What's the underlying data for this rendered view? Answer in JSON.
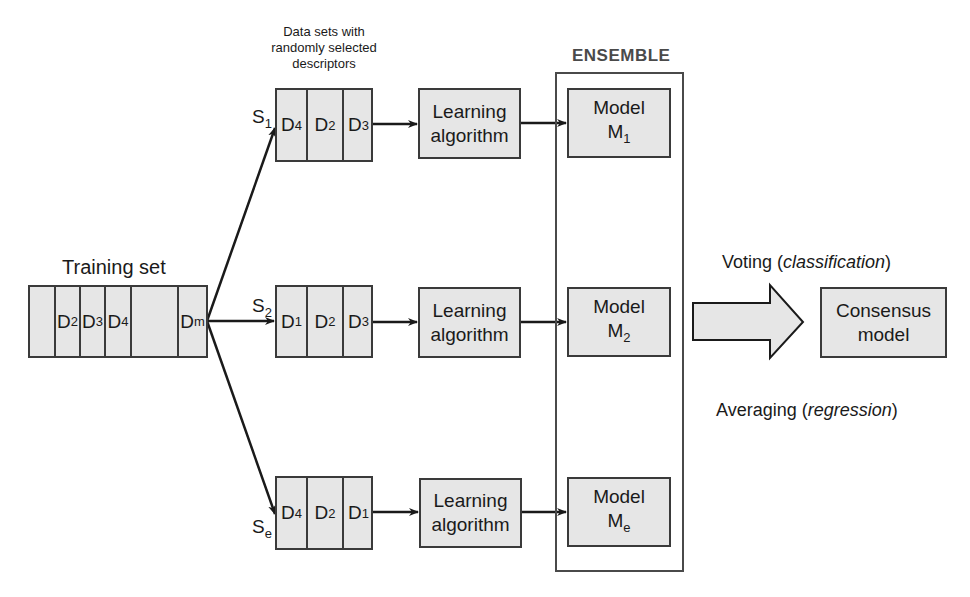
{
  "diagram": {
    "type": "random-subspace-ensemble-flow",
    "training_set": {
      "title": "Training set",
      "cells": [
        {
          "label": "",
          "sub": ""
        },
        {
          "label": "D",
          "sub": "2"
        },
        {
          "label": "D",
          "sub": "3"
        },
        {
          "label": "D",
          "sub": "4"
        },
        {
          "label": "",
          "sub": ""
        },
        {
          "label": "D",
          "sub": "m"
        }
      ]
    },
    "datasets_caption_lines": [
      "Data sets with",
      "randomly selected",
      "descriptors"
    ],
    "rows": [
      {
        "subset": {
          "label": "S",
          "sub": "1"
        },
        "cells": [
          {
            "label": "D",
            "sub": "4"
          },
          {
            "label": "D",
            "sub": "2"
          },
          {
            "label": "D",
            "sub": "3"
          }
        ],
        "learner": {
          "line1": "Learning",
          "line2": "algorithm"
        },
        "model": {
          "line1": "Model",
          "label": "M",
          "sub": "1"
        }
      },
      {
        "subset": {
          "label": "S",
          "sub": "2"
        },
        "cells": [
          {
            "label": "D",
            "sub": "1"
          },
          {
            "label": "D",
            "sub": "2"
          },
          {
            "label": "D",
            "sub": "3"
          }
        ],
        "learner": {
          "line1": "Learning",
          "line2": "algorithm"
        },
        "model": {
          "line1": "Model",
          "label": "M",
          "sub": "2"
        }
      },
      {
        "subset": {
          "label": "S",
          "sub": "e"
        },
        "cells": [
          {
            "label": "D",
            "sub": "4"
          },
          {
            "label": "D",
            "sub": "2"
          },
          {
            "label": "D",
            "sub": "1"
          }
        ],
        "learner": {
          "line1": "Learning",
          "line2": "algorithm"
        },
        "model": {
          "line1": "Model",
          "label": "M",
          "sub": "e"
        }
      }
    ],
    "ensemble": {
      "title": "ENSEMBLE"
    },
    "combination": {
      "voting": {
        "prefix": "Voting (",
        "italic": "classification",
        "suffix": ")"
      },
      "averaging": {
        "prefix": "Averaging (",
        "italic": "regression",
        "suffix": ")"
      }
    },
    "consensus": {
      "line1": "Consensus",
      "line2": "model"
    },
    "colors": {
      "box_fill": "#e6e6e6",
      "stroke": "#3a3a3a",
      "ensemble_title": "#4a4a4a"
    }
  }
}
